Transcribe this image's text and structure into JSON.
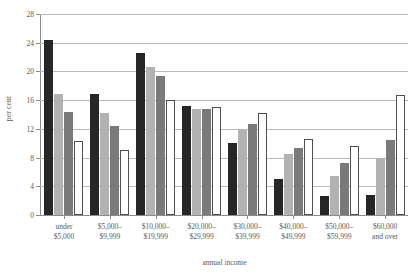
{
  "chart_data": {
    "type": "bar",
    "title": "",
    "xlabel": "annual income",
    "ylabel": "per cent",
    "ylim": [
      0,
      28
    ],
    "yticks": [
      0,
      4,
      8,
      12,
      16,
      20,
      24,
      28
    ],
    "grid": true,
    "legend": "none",
    "categories": [
      "under\n$5,000",
      "$5,000–\n$9,999",
      "$10,000–\n$19,999",
      "$20,000–\n$29,999",
      "$30,000–\n$39,999",
      "$40,000–\n$49,999",
      "$50,000–\n$59,999",
      "$60,000\nand over"
    ],
    "category_lines": [
      [
        "under",
        "$5,000"
      ],
      [
        "$5,000–",
        "$9,999"
      ],
      [
        "$10,000–",
        "$19,999"
      ],
      [
        "$20,000–",
        "$29,999"
      ],
      [
        "$30,000–",
        "$39,999"
      ],
      [
        "$40,000–",
        "$49,999"
      ],
      [
        "$50,000–",
        "$59,999"
      ],
      [
        "$60,000",
        "and over"
      ]
    ],
    "series": [
      {
        "name": "series-1",
        "color": "#262626",
        "style": "solid-black",
        "values": [
          24.4,
          16.8,
          22.5,
          15.2,
          10.0,
          5.0,
          2.6,
          2.8
        ]
      },
      {
        "name": "series-2",
        "color": "#b2b2b2",
        "style": "light-gray",
        "values": [
          16.9,
          14.2,
          20.6,
          14.7,
          11.8,
          8.5,
          5.5,
          8.0
        ]
      },
      {
        "name": "series-3",
        "color": "#7a7a7a",
        "style": "mid-gray",
        "values": [
          14.3,
          12.4,
          19.3,
          14.8,
          12.7,
          9.3,
          7.3,
          10.5
        ]
      },
      {
        "name": "series-4",
        "color": "#ffffff",
        "style": "white-outline",
        "values": [
          10.3,
          9.1,
          16.0,
          15.0,
          14.2,
          10.6,
          9.6,
          16.7
        ]
      }
    ]
  },
  "axes": {
    "ylabel": "per cent",
    "xlabel": "annual income"
  }
}
